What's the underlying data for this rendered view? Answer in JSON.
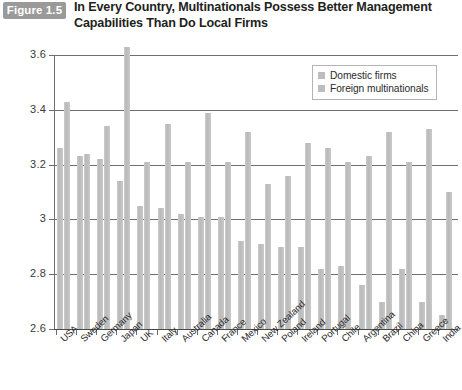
{
  "figure": {
    "badge": "Figure 1.5",
    "title": "In Every Country, Multinationals Possess Better Management Capabilities Than Do Local Firms"
  },
  "legend": {
    "position": "top-right",
    "items": [
      {
        "label": "Domestic firms",
        "color": "#bdbdbd"
      },
      {
        "label": "Foreign multinationals",
        "color": "#bdbdbd"
      }
    ]
  },
  "chart_data": {
    "type": "bar",
    "title": "In Every Country, Multinationals Possess Better Management Capabilities Than Do Local Firms",
    "xlabel": "",
    "ylabel": "",
    "ylim": [
      2.6,
      3.6
    ],
    "yticks": [
      "2.6",
      "2.8",
      "3",
      "3.2",
      "3.4",
      "3.6"
    ],
    "ytick_values": [
      2.6,
      2.8,
      3.0,
      3.2,
      3.4,
      3.6
    ],
    "grid": true,
    "legend_position": "top-right",
    "categories": [
      "USA",
      "Sweden",
      "Germany",
      "Japan",
      "UK",
      "Italy",
      "Australia",
      "Canada",
      "France",
      "Mexico",
      "New Zealand",
      "Poland",
      "Ireland",
      "Portugal",
      "Chile",
      "Argentina",
      "Brazil",
      "China",
      "Greece",
      "India"
    ],
    "series": [
      {
        "name": "Domestic firms",
        "color": "#bdbdbd",
        "values": [
          3.26,
          3.23,
          3.22,
          3.14,
          3.05,
          3.04,
          3.02,
          3.01,
          3.01,
          2.92,
          2.91,
          2.9,
          2.9,
          2.82,
          2.83,
          2.76,
          2.7,
          2.82,
          2.7,
          2.65
        ]
      },
      {
        "name": "Foreign multinationals",
        "color": "#bdbdbd",
        "values": [
          3.43,
          3.24,
          3.34,
          3.63,
          3.21,
          3.35,
          3.21,
          3.39,
          3.21,
          3.32,
          3.13,
          3.16,
          3.28,
          3.26,
          3.21,
          3.23,
          3.32,
          3.21,
          3.33,
          3.1
        ]
      }
    ]
  }
}
